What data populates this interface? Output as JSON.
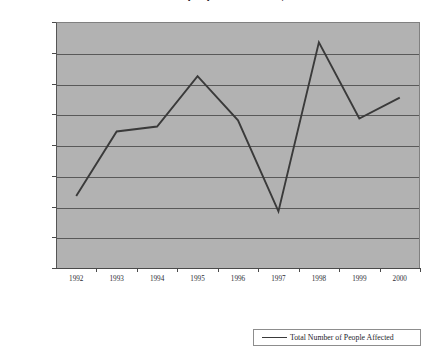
{
  "chart_data": {
    "type": "line",
    "title": "Total number of people affected by disasters",
    "xlabel": "",
    "ylabel": "",
    "categories": [
      "1992",
      "1993",
      "1994",
      "1995",
      "1996",
      "1997",
      "1998",
      "1999",
      "2000"
    ],
    "series": [
      {
        "name": "Total Number of People Affected",
        "values": [
          117000000,
          222000000,
          230000000,
          312000000,
          240000000,
          92000000,
          367000000,
          243000000,
          277000000
        ],
        "color": "#3a3a3a"
      }
    ],
    "ylim": [
      0,
      400000000
    ],
    "ytick_values": [
      0,
      50000000,
      100000000,
      150000000,
      200000000,
      250000000,
      300000000,
      350000000,
      400000000
    ],
    "ytick_labels": [
      "0",
      "50,000,000",
      "100,000,000",
      "150,000,000",
      "200,000,000",
      "250,000,000",
      "300,000,000",
      "350,000,000",
      "400,000,000"
    ],
    "grid": true,
    "legend_position": "bottom-right",
    "plot_background": "#b2b2b2",
    "gridline_color": "#595959"
  },
  "legend": {
    "entries": [
      {
        "label": "Total Number of People Affected",
        "color": "#3a3a3a"
      }
    ]
  }
}
